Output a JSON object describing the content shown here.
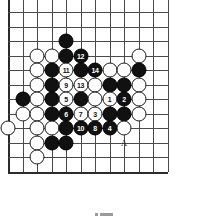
{
  "diagram": {
    "kind": "go-board-diagram",
    "title": "",
    "grid": {
      "cols": 12,
      "rows": 12,
      "spacing": 14.5,
      "origin_x": 8,
      "origin_y": 12
    },
    "board_color": "#ffffff",
    "line_color": "#4a4a4a",
    "edge_color": "#2b2b2b",
    "black_color": "#111111",
    "white_color": "#ffffff"
  },
  "star_points": [
    {
      "col": 9,
      "row": 3
    }
  ],
  "stones": [
    {
      "col": 4,
      "row": 2,
      "color": "black",
      "label": ""
    },
    {
      "col": 2,
      "row": 3,
      "color": "white",
      "label": ""
    },
    {
      "col": 3,
      "row": 3,
      "color": "white",
      "label": ""
    },
    {
      "col": 4,
      "row": 3,
      "color": "black",
      "label": ""
    },
    {
      "col": 5,
      "row": 3,
      "color": "black",
      "label": "12"
    },
    {
      "col": 9,
      "row": 3,
      "color": "white",
      "label": ""
    },
    {
      "col": 2,
      "row": 4,
      "color": "white",
      "label": ""
    },
    {
      "col": 3,
      "row": 4,
      "color": "black",
      "label": ""
    },
    {
      "col": 4,
      "row": 4,
      "color": "white",
      "label": "11"
    },
    {
      "col": 5,
      "row": 4,
      "color": "black",
      "label": ""
    },
    {
      "col": 6,
      "row": 4,
      "color": "black",
      "label": "14"
    },
    {
      "col": 7,
      "row": 4,
      "color": "white",
      "label": ""
    },
    {
      "col": 8,
      "row": 4,
      "color": "white",
      "label": ""
    },
    {
      "col": 9,
      "row": 4,
      "color": "black",
      "label": ""
    },
    {
      "col": 2,
      "row": 5,
      "color": "white",
      "label": ""
    },
    {
      "col": 3,
      "row": 5,
      "color": "black",
      "label": ""
    },
    {
      "col": 4,
      "row": 5,
      "color": "white",
      "label": "9"
    },
    {
      "col": 5,
      "row": 5,
      "color": "white",
      "label": "13"
    },
    {
      "col": 6,
      "row": 5,
      "color": "white",
      "label": ""
    },
    {
      "col": 7,
      "row": 5,
      "color": "black",
      "label": ""
    },
    {
      "col": 8,
      "row": 5,
      "color": "black",
      "label": ""
    },
    {
      "col": 9,
      "row": 5,
      "color": "white",
      "label": ""
    },
    {
      "col": 1,
      "row": 6,
      "color": "black",
      "label": ""
    },
    {
      "col": 2,
      "row": 6,
      "color": "white",
      "label": ""
    },
    {
      "col": 3,
      "row": 6,
      "color": "black",
      "label": ""
    },
    {
      "col": 4,
      "row": 6,
      "color": "white",
      "label": "5"
    },
    {
      "col": 5,
      "row": 6,
      "color": "black",
      "label": ""
    },
    {
      "col": 6,
      "row": 6,
      "color": "white",
      "label": ""
    },
    {
      "col": 7,
      "row": 6,
      "color": "white",
      "label": "1"
    },
    {
      "col": 8,
      "row": 6,
      "color": "black",
      "label": "2"
    },
    {
      "col": 9,
      "row": 6,
      "color": "white",
      "label": ""
    },
    {
      "col": 1,
      "row": 7,
      "color": "white",
      "label": ""
    },
    {
      "col": 2,
      "row": 7,
      "color": "white",
      "label": ""
    },
    {
      "col": 3,
      "row": 7,
      "color": "black",
      "label": ""
    },
    {
      "col": 4,
      "row": 7,
      "color": "black",
      "label": "6"
    },
    {
      "col": 5,
      "row": 7,
      "color": "white",
      "label": "7"
    },
    {
      "col": 6,
      "row": 7,
      "color": "white",
      "label": "3"
    },
    {
      "col": 7,
      "row": 7,
      "color": "black",
      "label": ""
    },
    {
      "col": 8,
      "row": 7,
      "color": "black",
      "label": ""
    },
    {
      "col": 9,
      "row": 7,
      "color": "white",
      "label": ""
    },
    {
      "col": 0,
      "row": 8,
      "color": "white",
      "label": ""
    },
    {
      "col": 2,
      "row": 8,
      "color": "white",
      "label": ""
    },
    {
      "col": 3,
      "row": 8,
      "color": "white",
      "label": ""
    },
    {
      "col": 4,
      "row": 8,
      "color": "black",
      "label": ""
    },
    {
      "col": 5,
      "row": 8,
      "color": "black",
      "label": "10"
    },
    {
      "col": 6,
      "row": 8,
      "color": "black",
      "label": "8"
    },
    {
      "col": 7,
      "row": 8,
      "color": "black",
      "label": "4"
    },
    {
      "col": 8,
      "row": 8,
      "color": "white",
      "label": ""
    },
    {
      "col": 2,
      "row": 9,
      "color": "white",
      "label": ""
    },
    {
      "col": 3,
      "row": 9,
      "color": "black",
      "label": ""
    },
    {
      "col": 4,
      "row": 9,
      "color": "black",
      "label": ""
    },
    {
      "col": 2,
      "row": 10,
      "color": "white",
      "label": ""
    }
  ],
  "point_labels": [
    {
      "col": 8,
      "row": 9,
      "text": "A"
    }
  ],
  "caption": {
    "dot": "",
    "bar": ""
  }
}
